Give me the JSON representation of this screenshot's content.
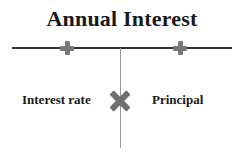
{
  "diagram": {
    "title": "Annual Interest",
    "left_factor": "Interest rate",
    "right_factor": "Principal",
    "operator": "multiply",
    "markers": [
      "plus",
      "plus"
    ],
    "colors": {
      "text": "#1a1a1a",
      "horizontal_line": "#333333",
      "vertical_line": "#9a9a9a",
      "marker": "#777777",
      "operator": "#6f6f6f"
    }
  }
}
